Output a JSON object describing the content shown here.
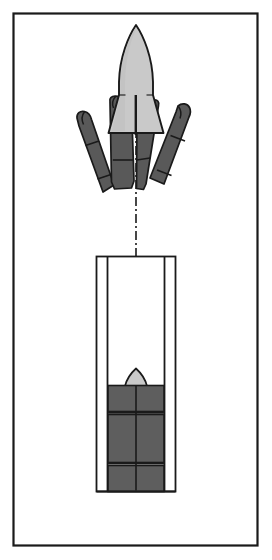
{
  "figure": {
    "domain": "Diagram",
    "canvas": {
      "width": 272,
      "height": 560,
      "background": "#ffffff"
    }
  },
  "colors": {
    "outline": "#1a1a1a",
    "frame_border": "#1a1a1a",
    "missile_body": "#c9c9c9",
    "missile_body_shade": "#bdbdbd",
    "petal_dark": "#595959",
    "petal_dark_edge": "#4a4a4a",
    "canister_fill": "#5e5e5e",
    "tube_wall": "#ffffff",
    "page_white": "#ffffff",
    "centerline": "#1a1a1a"
  },
  "frame": {
    "label": "figure-border",
    "x": 13,
    "y": 13,
    "width": 245,
    "height": 533,
    "stroke_width": 2.2
  },
  "centerline": {
    "label": "axis-of-symmetry",
    "x": 136,
    "y_top": 112,
    "y_bottom": 385,
    "pattern": "dash-dot",
    "dash_array": "9 3 2 3",
    "stroke_width": 1.6
  },
  "upper_assembly": {
    "label": "ejecting-missile-assembly",
    "missile": {
      "label": "missile-in-flight",
      "nose_tip_y": 25,
      "body_width": 34,
      "tail_y": 133,
      "fin_span": 60,
      "slot": {
        "x": 135,
        "y_top": 96,
        "y_bottom": 135,
        "width": 2
      }
    },
    "petals": [
      {
        "name": "petal-outer-left",
        "position": "outer-left",
        "rotation_deg": -16,
        "band_count": 2
      },
      {
        "name": "petal-inner-left",
        "position": "inner-left",
        "rotation_deg": -8,
        "band_count": 2
      },
      {
        "name": "petal-inner-right",
        "position": "inner-right",
        "rotation_deg": 12,
        "band_count": 2
      },
      {
        "name": "petal-outer-right",
        "position": "outer-right",
        "rotation_deg": 14,
        "band_count": 2
      }
    ]
  },
  "lower_assembly": {
    "label": "launch-tube-with-stowed-missile",
    "tube": {
      "label": "canister-outer-shell",
      "x": 96,
      "y": 256,
      "width": 80,
      "height": 236,
      "wall_thickness": 11
    },
    "inner_bore": {
      "label": "canister-inner-bore",
      "x": 107,
      "y": 256,
      "width": 58,
      "height": 236
    },
    "stowed_missile": {
      "label": "stowed-missile-nose",
      "nose_apex_y": 369,
      "nose_base_y": 385,
      "nose_half_width": 11
    },
    "canister_segments": [
      {
        "name": "segment-upper",
        "y": 385,
        "height": 26
      },
      {
        "name": "segment-middle",
        "y": 414,
        "height": 48
      },
      {
        "name": "segment-lower",
        "y": 465,
        "height": 26
      }
    ],
    "segment_divider_count": 2,
    "vertical_seam_x": 136
  }
}
